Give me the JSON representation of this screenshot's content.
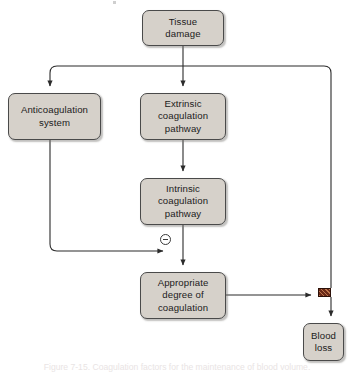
{
  "figure": {
    "domain": "diagram",
    "type": "flowchart",
    "caption": "Figure 7-15. Coagulation factors for the maintenance of blood volume.",
    "background_color": "#ffffff",
    "node_fill_color": "#d6d1ca",
    "node_border_color": "#4a4a4a",
    "edge_color": "#2b2b2b",
    "block_marker_color": "#6a2a18"
  },
  "nodes": [
    {
      "id": "tissue-damage",
      "label": "Tissue\ndamage",
      "x": 142,
      "y": 10,
      "w": 82,
      "h": 36
    },
    {
      "id": "anticoagulation-system",
      "label": "Anticoagulation\nsystem",
      "x": 8,
      "y": 93,
      "w": 93,
      "h": 47
    },
    {
      "id": "extrinsic-coagulation-pathway",
      "label": "Extrinsic\ncoagulation\npathway",
      "x": 140,
      "y": 93,
      "w": 86,
      "h": 47
    },
    {
      "id": "intrinsic-coagulation-pathway",
      "label": "Intrinsic\ncoagulation\npathway",
      "x": 140,
      "y": 178,
      "w": 86,
      "h": 47
    },
    {
      "id": "appropriate-degree-of-coagulation",
      "label": "Appropriate\ndegree of\ncoagulation",
      "x": 140,
      "y": 272,
      "w": 86,
      "h": 47
    },
    {
      "id": "blood-loss",
      "label": "Blood\nloss",
      "x": 303,
      "y": 323,
      "w": 41,
      "h": 38
    }
  ],
  "markers": [
    {
      "id": "inhibition-minus",
      "symbol": "circled-minus",
      "meaning": "inhibition",
      "x": 160,
      "y": 234
    },
    {
      "id": "blocked-pathway",
      "symbol": "hatched-block",
      "meaning": "blocks blood loss",
      "x": 318,
      "y": 288,
      "w": 13,
      "h": 9
    }
  ],
  "edges": [
    {
      "id": "tissue-to-branch",
      "from": "tissue-damage",
      "to": "branch-bus",
      "kind": "arrow"
    },
    {
      "id": "branch-to-anticoagulation",
      "from": "branch-bus",
      "to": "anticoagulation-system",
      "kind": "arrow"
    },
    {
      "id": "branch-to-extrinsic",
      "from": "branch-bus",
      "to": "extrinsic-coagulation-pathway",
      "kind": "arrow"
    },
    {
      "id": "branch-to-blood-loss-line",
      "from": "branch-bus",
      "to": "blocked-pathway",
      "kind": "line"
    },
    {
      "id": "extrinsic-to-intrinsic",
      "from": "extrinsic-coagulation-pathway",
      "to": "intrinsic-coagulation-pathway",
      "kind": "arrow"
    },
    {
      "id": "intrinsic-to-appropriate",
      "from": "intrinsic-coagulation-pathway",
      "to": "appropriate-degree-of-coagulation",
      "kind": "arrow"
    },
    {
      "id": "anticoagulation-to-inhibit",
      "from": "anticoagulation-system",
      "to": "inhibition-minus",
      "kind": "arrow"
    },
    {
      "id": "appropriate-to-block",
      "from": "appropriate-degree-of-coagulation",
      "to": "blocked-pathway",
      "kind": "arrow"
    },
    {
      "id": "block-to-blood-loss",
      "from": "blocked-pathway",
      "to": "blood-loss",
      "kind": "arrow"
    }
  ]
}
